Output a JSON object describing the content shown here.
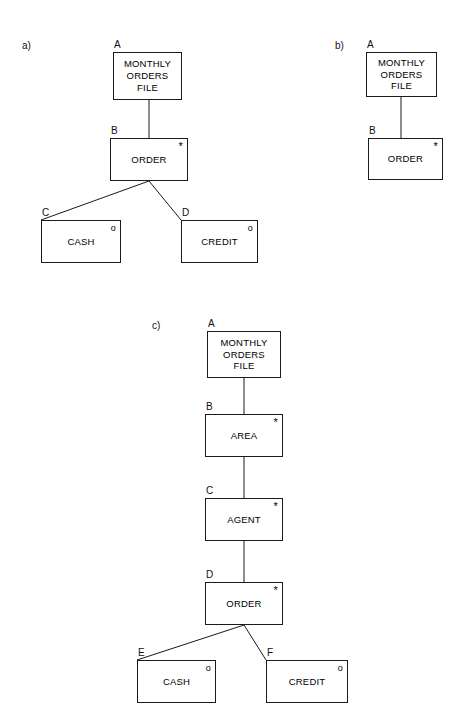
{
  "page": {
    "background": "#ffffff",
    "line_color": "#1a1a1a",
    "text_color": "#000000"
  },
  "figures": [
    {
      "key": "a",
      "caption": "a)",
      "caption_pos": {
        "x": 22,
        "y": 40
      },
      "nodes": [
        {
          "key": "a_A",
          "id": "A",
          "text": "MONTHLY\nORDERS\nFILE",
          "marker": "",
          "box": {
            "x": 113,
            "y": 52,
            "w": 69,
            "h": 48
          },
          "id_pos": {
            "x": 114,
            "y": 39
          }
        },
        {
          "key": "a_B",
          "id": "B",
          "text": "ORDER",
          "marker": "*",
          "box": {
            "x": 110,
            "y": 138,
            "w": 78,
            "h": 43
          },
          "id_pos": {
            "x": 111,
            "y": 125
          }
        },
        {
          "key": "a_C",
          "id": "C",
          "text": "CASH",
          "marker": "o",
          "box": {
            "x": 41,
            "y": 220,
            "w": 80,
            "h": 43
          },
          "id_pos": {
            "x": 42,
            "y": 207
          }
        },
        {
          "key": "a_D",
          "id": "D",
          "text": "CREDIT",
          "marker": "o",
          "box": {
            "x": 181,
            "y": 220,
            "w": 77,
            "h": 43
          },
          "id_pos": {
            "x": 182,
            "y": 207
          }
        }
      ],
      "edges": [
        {
          "from": "a_A",
          "to": "a_B",
          "type": "vertical",
          "x1": 149,
          "y1": 100,
          "x2": 149,
          "y2": 138
        },
        {
          "from": "a_B",
          "to": "a_C",
          "type": "diagonal",
          "x1": 149,
          "y1": 181,
          "x2": 41,
          "y2": 220
        },
        {
          "from": "a_B",
          "to": "a_D",
          "type": "diagonal",
          "x1": 149,
          "y1": 181,
          "x2": 181,
          "y2": 220
        }
      ]
    },
    {
      "key": "b",
      "caption": "b)",
      "caption_pos": {
        "x": 335,
        "y": 40
      },
      "nodes": [
        {
          "key": "b_A",
          "id": "A",
          "text": "MONTHLY\nORDERS\nFILE",
          "marker": "",
          "box": {
            "x": 366,
            "y": 52,
            "w": 71,
            "h": 45
          },
          "id_pos": {
            "x": 367,
            "y": 39
          }
        },
        {
          "key": "b_B",
          "id": "B",
          "text": "ORDER",
          "marker": "*",
          "box": {
            "x": 368,
            "y": 138,
            "w": 75,
            "h": 42
          },
          "id_pos": {
            "x": 369,
            "y": 125
          }
        }
      ],
      "edges": [
        {
          "from": "b_A",
          "to": "b_B",
          "type": "vertical",
          "x1": 401,
          "y1": 97,
          "x2": 401,
          "y2": 138
        }
      ]
    },
    {
      "key": "c",
      "caption": "c)",
      "caption_pos": {
        "x": 152,
        "y": 320
      },
      "nodes": [
        {
          "key": "c_A",
          "id": "A",
          "text": "MONTHLY\nORDERS\nFILE",
          "marker": "",
          "box": {
            "x": 207,
            "y": 331,
            "w": 74,
            "h": 47
          },
          "id_pos": {
            "x": 208,
            "y": 318
          }
        },
        {
          "key": "c_B",
          "id": "B",
          "text": "AREA",
          "marker": "*",
          "box": {
            "x": 205,
            "y": 414,
            "w": 78,
            "h": 43
          },
          "id_pos": {
            "x": 206,
            "y": 401
          }
        },
        {
          "key": "c_C",
          "id": "C",
          "text": "AGENT",
          "marker": "*",
          "box": {
            "x": 205,
            "y": 498,
            "w": 78,
            "h": 43
          },
          "id_pos": {
            "x": 206,
            "y": 485
          }
        },
        {
          "key": "c_D",
          "id": "D",
          "text": "ORDER",
          "marker": "*",
          "box": {
            "x": 205,
            "y": 582,
            "w": 78,
            "h": 43
          },
          "id_pos": {
            "x": 206,
            "y": 569
          }
        },
        {
          "key": "c_E",
          "id": "E",
          "text": "CASH",
          "marker": "o",
          "box": {
            "x": 137,
            "y": 660,
            "w": 79,
            "h": 43
          },
          "id_pos": {
            "x": 138,
            "y": 647
          }
        },
        {
          "key": "c_F",
          "id": "F",
          "text": "CREDIT",
          "marker": "o",
          "box": {
            "x": 266,
            "y": 660,
            "w": 82,
            "h": 43
          },
          "id_pos": {
            "x": 267,
            "y": 647
          }
        }
      ],
      "edges": [
        {
          "from": "c_A",
          "to": "c_B",
          "type": "vertical",
          "x1": 244,
          "y1": 378,
          "x2": 244,
          "y2": 414
        },
        {
          "from": "c_B",
          "to": "c_C",
          "type": "vertical",
          "x1": 244,
          "y1": 457,
          "x2": 244,
          "y2": 498
        },
        {
          "from": "c_C",
          "to": "c_D",
          "type": "vertical",
          "x1": 244,
          "y1": 541,
          "x2": 244,
          "y2": 582
        },
        {
          "from": "c_D",
          "to": "c_E",
          "type": "diagonal",
          "x1": 244,
          "y1": 625,
          "x2": 137,
          "y2": 660
        },
        {
          "from": "c_D",
          "to": "c_F",
          "type": "diagonal",
          "x1": 244,
          "y1": 625,
          "x2": 266,
          "y2": 660
        }
      ]
    }
  ]
}
